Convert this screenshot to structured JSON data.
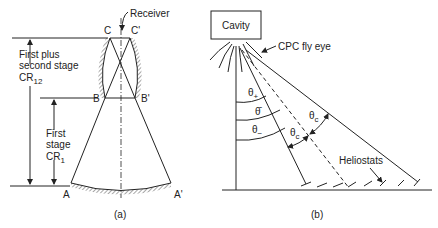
{
  "panel_a": {
    "caption": "(a)",
    "receiver_label": "Receiver",
    "points": {
      "C": "C",
      "C_prime": "C'",
      "B": "B",
      "B_prime": "B'",
      "A": "A",
      "A_prime": "A'"
    },
    "dimension_outer": {
      "line1": "First plus",
      "line2": "second stage",
      "line3": "CR",
      "subscript": "12"
    },
    "dimension_inner": {
      "line1": "First",
      "line2": "stage",
      "line3": "CR",
      "subscript": "1"
    }
  },
  "panel_b": {
    "caption": "(b)",
    "cavity_label": "Cavity",
    "cpc_label": "CPC fly eye",
    "heliostats_label": "Heliostats",
    "angles": {
      "theta_plus": "θ",
      "theta_plus_sub": "+",
      "theta_bar": "θ̄",
      "theta_minus": "θ",
      "theta_minus_sub": "−",
      "theta_c": "θ",
      "theta_c_sub": "c"
    }
  }
}
